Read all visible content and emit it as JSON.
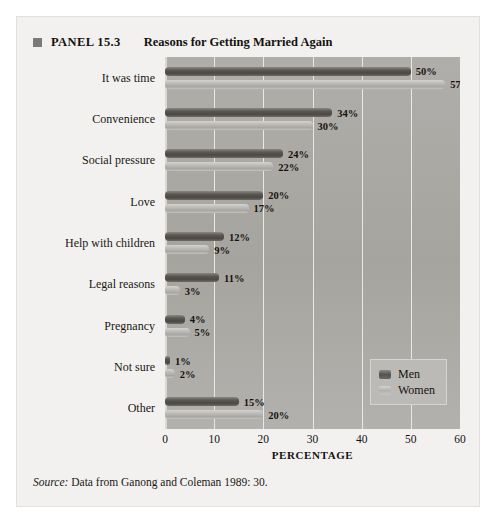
{
  "panel": {
    "bullet_icon": "square-bullet-icon",
    "number": "PANEL 15.3",
    "title": "Reasons for Getting Married Again"
  },
  "source": {
    "label": "Source:",
    "text": "Data from Ganong and Coleman 1989: 30."
  },
  "legend": {
    "men_label": "Men",
    "women_label": "Women"
  },
  "axis": {
    "x_title": "PERCENTAGE",
    "ticks": [
      "0",
      "10",
      "20",
      "30",
      "40",
      "50",
      "60"
    ]
  },
  "colors": {
    "men_bar": "#565350",
    "women_bar": "#bcbab6",
    "plot_background": "#a9a7a3",
    "panel_background": "#f2f1ef",
    "gridline": "#e9e8e5"
  },
  "chart_data": {
    "type": "bar",
    "orientation": "horizontal",
    "title": "Reasons for Getting Married Again",
    "xlabel": "PERCENTAGE",
    "ylabel": "",
    "xlim": [
      0,
      60
    ],
    "xticks": [
      0,
      10,
      20,
      30,
      40,
      50,
      60
    ],
    "grid": true,
    "legend_position": "bottom-right",
    "categories": [
      "It was time",
      "Convenience",
      "Social pressure",
      "Love",
      "Help with children",
      "Legal reasons",
      "Pregnancy",
      "Not sure",
      "Other"
    ],
    "series": [
      {
        "name": "Men",
        "values": [
          50,
          34,
          24,
          20,
          12,
          11,
          4,
          1,
          15
        ],
        "labels": [
          "50%",
          "34%",
          "24%",
          "20%",
          "12%",
          "11%",
          "4%",
          "1%",
          "15%"
        ]
      },
      {
        "name": "Women",
        "values": [
          57,
          30,
          22,
          17,
          9,
          3,
          5,
          2,
          20
        ],
        "labels": [
          "57%",
          "30%",
          "22%",
          "17%",
          "9%",
          "3%",
          "5%",
          "2%",
          "20%"
        ]
      }
    ]
  }
}
